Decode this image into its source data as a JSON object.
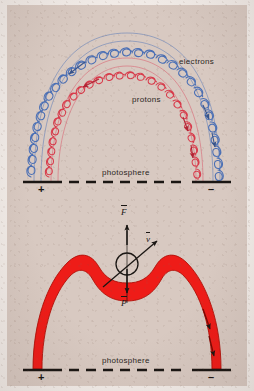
{
  "figure": {
    "background_color": "#d8c9c1",
    "page_color": "#f2ece8"
  },
  "colors": {
    "electron_blue": "#4a6fb5",
    "proton_red": "#d83a4a",
    "flux_tube_red": "#ee1c18",
    "flux_tube_outline": "#b01008",
    "ink_black": "#1a1613",
    "label_text": "#2b2622"
  },
  "panel_top": {
    "name": "charged-particle-spiral-panel",
    "labels": {
      "electrons": "electrons",
      "protons": "protons",
      "photosphere": "photosphere"
    },
    "polarity": {
      "left": "+",
      "right": "–"
    },
    "series": [
      {
        "name": "electrons",
        "color": "#4a6fb5",
        "description": "outer arch, helical coil with downward-pointing arrowheads",
        "coil_loops": 26
      },
      {
        "name": "protons",
        "color": "#d83a4a",
        "description": "inner arch, helical coil with downward-pointing arrowheads",
        "coil_loops": 22
      }
    ]
  },
  "panel_bottom": {
    "name": "magnetic-flux-tube-panel",
    "labels": {
      "photosphere": "photosphere"
    },
    "polarity": {
      "left": "+",
      "right": "–"
    },
    "vectors": [
      {
        "symbol": "F",
        "overbar": true,
        "direction": "up",
        "name": "force-vector"
      },
      {
        "symbol": "v",
        "overbar": true,
        "direction": "up-right",
        "name": "velocity-vector"
      },
      {
        "symbol": "P",
        "overbar": true,
        "direction": "down",
        "name": "pressure-vector"
      }
    ],
    "tube": {
      "color": "#ee1c18",
      "description": "solid red flux tube arch with central dip at apex, downward flow arrowheads on right leg"
    },
    "parcel": {
      "name": "plasma-parcel-circle",
      "description": "open circle at apex marking the plasma parcel"
    }
  }
}
